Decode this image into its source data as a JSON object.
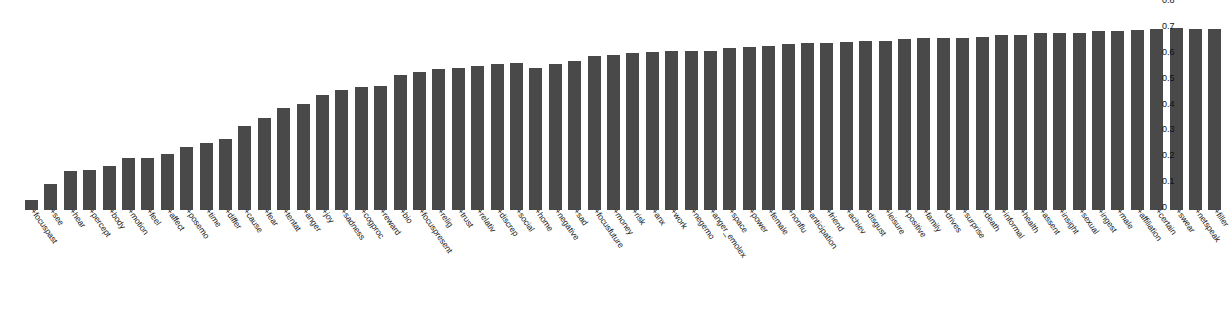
{
  "chart_data": {
    "type": "bar",
    "title": "",
    "subtitle": "",
    "xlabel": "",
    "ylabel": "",
    "ylim": [
      0,
      0.8
    ],
    "grid": false,
    "legend": null,
    "y_axis_position": "right",
    "x_tick_rotation": 55,
    "bar_color": "#494949",
    "background_color": "#ffffff",
    "yticks": [
      "0.8",
      "0.7",
      "0.6",
      "0.5",
      "0.4",
      "0.3",
      "0.2",
      "0.1",
      "0"
    ],
    "ytick_values": [
      0.8,
      0.7,
      0.6,
      0.5,
      0.4,
      0.3,
      0.2,
      0.1,
      0
    ],
    "categories": [
      "+focuspast",
      "+see",
      "+hear",
      "+percept",
      "+body",
      "+motion",
      "+feel",
      "+affect",
      "+posemo",
      "+time",
      "+differ",
      "+cause",
      "+fear",
      "+tentat",
      "+anger",
      "+joy",
      "+sadness",
      "+cogproc",
      "+reward",
      "+bio",
      "+focuspresent",
      "+relig",
      "+trust",
      "+relativ",
      "+discrep",
      "+social",
      "+home",
      "+negative",
      "+sad",
      "+focusfuture",
      "+money",
      "+risk",
      "+anx",
      "+work",
      "+negemo",
      "+anger_emolex",
      "+space",
      "+power",
      "+female",
      "+nonflu",
      "+anticipation",
      "+friend",
      "+achiev",
      "+disgust",
      "+leisure",
      "+positive",
      "+family",
      "+drives",
      "+surprise",
      "+death",
      "+informal",
      "+health",
      "+assent",
      "+insight",
      "+sexual",
      "+ingest",
      "+male",
      "+affiliation",
      "+certain",
      "+swear",
      "+netspeak",
      "+filler"
    ],
    "values": [
      0.04,
      0.1,
      0.15,
      0.155,
      0.17,
      0.2,
      0.2,
      0.215,
      0.245,
      0.26,
      0.275,
      0.325,
      0.355,
      0.395,
      0.41,
      0.445,
      0.465,
      0.475,
      0.48,
      0.52,
      0.535,
      0.545,
      0.55,
      0.555,
      0.565,
      0.57,
      0.55,
      0.565,
      0.575,
      0.595,
      0.6,
      0.605,
      0.61,
      0.615,
      0.615,
      0.615,
      0.625,
      0.63,
      0.635,
      0.64,
      0.645,
      0.645,
      0.65,
      0.655,
      0.655,
      0.66,
      0.665,
      0.665,
      0.665,
      0.67,
      0.675,
      0.675,
      0.685,
      0.685,
      0.685,
      0.69,
      0.69,
      0.695,
      0.7,
      0.705,
      0.7,
      0.7
    ]
  }
}
